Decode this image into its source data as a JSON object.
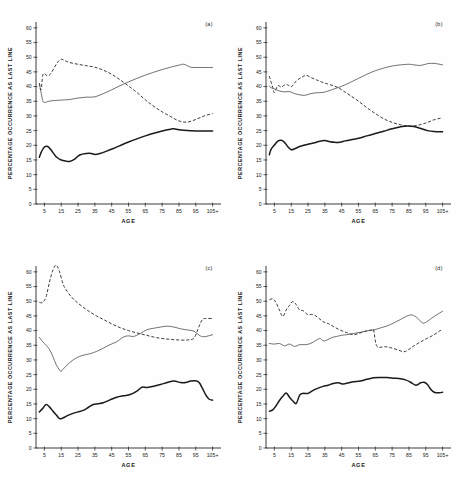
{
  "figure": {
    "axis_title_x": "AGE",
    "axis_title_y": "PERCENTAGE OCCURRENCE AS LAST LINE"
  },
  "chart_data": [
    {
      "type": "line",
      "tag": "(a)",
      "title": "",
      "xlabel": "AGE",
      "ylabel": "PERCENTAGE OCCURRENCE AS LAST LINE",
      "xlim": [
        0,
        110
      ],
      "ylim": [
        0,
        62
      ],
      "yticks": [
        0,
        5,
        10,
        15,
        20,
        25,
        30,
        35,
        40,
        45,
        50,
        55,
        60
      ],
      "xticks": [
        5,
        15,
        25,
        35,
        45,
        55,
        65,
        75,
        85,
        95,
        105
      ],
      "xticklabels": [
        "5",
        "15",
        "25",
        "35",
        "45",
        "55",
        "65",
        "75",
        "85",
        "95",
        "105+"
      ],
      "grid": false,
      "legend": "none",
      "series": [
        {
          "name": "dashed",
          "style": "dashed",
          "x": [
            2,
            3,
            4,
            5,
            7,
            9,
            11,
            13,
            15,
            17,
            20,
            25,
            30,
            35,
            40,
            45,
            50,
            55,
            60,
            65,
            70,
            75,
            80,
            85,
            90,
            95,
            100,
            105
          ],
          "values": [
            41.2,
            38.9,
            43.8,
            44.4,
            43.6,
            44.6,
            46.6,
            48.4,
            49.3,
            48.9,
            48.2,
            47.6,
            47.1,
            46.6,
            45.6,
            44.2,
            42.3,
            40.2,
            38.0,
            35.5,
            33.3,
            31.4,
            29.8,
            28.3,
            27.9,
            28.8,
            30.0,
            30.8
          ]
        },
        {
          "name": "thin-solid",
          "style": "thin",
          "x": [
            2,
            3,
            4,
            5,
            7,
            10,
            15,
            20,
            25,
            30,
            35,
            40,
            45,
            50,
            55,
            60,
            65,
            70,
            75,
            80,
            85,
            88,
            92,
            96,
            100,
            105
          ],
          "values": [
            41.0,
            38.0,
            35.2,
            34.6,
            34.9,
            35.2,
            35.4,
            35.6,
            36.1,
            36.4,
            36.5,
            37.6,
            38.9,
            40.3,
            41.6,
            42.8,
            43.9,
            44.9,
            45.8,
            46.6,
            47.3,
            47.6,
            46.6,
            46.5,
            46.5,
            46.5
          ]
        },
        {
          "name": "thick-solid",
          "style": "thick",
          "x": [
            2,
            3,
            5,
            7,
            9,
            12,
            15,
            18,
            20,
            23,
            26,
            30,
            33,
            35,
            38,
            42,
            46,
            50,
            55,
            60,
            65,
            70,
            75,
            80,
            82,
            85,
            90,
            95,
            100,
            105
          ],
          "values": [
            15.9,
            17.5,
            19.4,
            19.6,
            18.4,
            16.1,
            15.0,
            14.6,
            14.5,
            15.3,
            16.7,
            17.2,
            17.2,
            16.9,
            17.2,
            18.0,
            18.9,
            19.9,
            21.1,
            22.2,
            23.2,
            24.1,
            24.9,
            25.5,
            25.6,
            25.3,
            25.0,
            24.9,
            24.9,
            24.9
          ]
        }
      ]
    },
    {
      "type": "line",
      "tag": "(b)",
      "title": "",
      "xlabel": "AGE",
      "ylabel": "PERCENTAGE OCCURRENCE AS LAST LINE",
      "xlim": [
        0,
        110
      ],
      "ylim": [
        0,
        62
      ],
      "yticks": [
        0,
        5,
        10,
        15,
        20,
        25,
        30,
        35,
        40,
        45,
        50,
        55,
        60
      ],
      "xticks": [
        5,
        15,
        25,
        35,
        45,
        55,
        65,
        75,
        85,
        95,
        105
      ],
      "xticklabels": [
        "5",
        "15",
        "25",
        "35",
        "45",
        "55",
        "65",
        "75",
        "85",
        "95",
        "105+"
      ],
      "grid": false,
      "legend": "none",
      "series": [
        {
          "name": "dashed",
          "style": "dashed",
          "x": [
            2,
            3,
            4,
            5,
            7,
            9,
            11,
            13,
            15,
            18,
            21,
            24,
            27,
            30,
            33,
            36,
            40,
            43,
            46,
            50,
            55,
            60,
            65,
            70,
            75,
            80,
            85,
            90,
            95,
            100,
            105
          ],
          "values": [
            43.6,
            41.5,
            39.7,
            38.0,
            40.3,
            39.8,
            40.5,
            40.6,
            39.9,
            41.9,
            43.1,
            43.8,
            43.0,
            42.3,
            41.6,
            41.0,
            40.3,
            39.6,
            38.5,
            37.0,
            35.0,
            32.8,
            30.8,
            29.0,
            27.8,
            27.0,
            26.5,
            26.8,
            27.6,
            28.7,
            29.4
          ]
        },
        {
          "name": "thin-solid",
          "style": "thin",
          "x": [
            2,
            3,
            5,
            8,
            11,
            14,
            17,
            20,
            23,
            26,
            30,
            34,
            38,
            41,
            45,
            50,
            55,
            60,
            65,
            70,
            75,
            80,
            85,
            88,
            92,
            96,
            100,
            105
          ],
          "values": [
            40.2,
            39.6,
            39.2,
            38.5,
            38.2,
            38.3,
            37.6,
            37.2,
            37.0,
            37.5,
            37.9,
            38.0,
            38.7,
            39.3,
            40.1,
            41.4,
            42.8,
            44.2,
            45.4,
            46.3,
            47.0,
            47.4,
            47.6,
            47.4,
            47.2,
            47.8,
            47.9,
            47.4
          ]
        },
        {
          "name": "thick-solid",
          "style": "thick",
          "x": [
            2,
            3,
            5,
            7,
            9,
            11,
            13,
            15,
            17,
            20,
            23,
            26,
            29,
            32,
            35,
            38,
            41,
            44,
            47,
            50,
            55,
            60,
            65,
            70,
            75,
            80,
            84,
            88,
            92,
            96,
            100,
            105
          ],
          "values": [
            16.8,
            18.6,
            20.1,
            21.4,
            21.7,
            21.0,
            19.5,
            18.5,
            18.8,
            19.6,
            20.1,
            20.5,
            20.9,
            21.4,
            21.6,
            21.2,
            21.0,
            21.0,
            21.5,
            21.8,
            22.4,
            23.2,
            24.0,
            24.8,
            25.6,
            26.3,
            26.6,
            26.4,
            25.7,
            25.0,
            24.7,
            24.6
          ]
        }
      ]
    },
    {
      "type": "line",
      "tag": "(c)",
      "title": "",
      "xlabel": "AGE",
      "ylabel": "PERCENTAGE OCCURRENCE AS LAST LINE",
      "xlim": [
        0,
        110
      ],
      "ylim": [
        0,
        62
      ],
      "yticks": [
        0,
        5,
        10,
        15,
        20,
        25,
        30,
        35,
        40,
        45,
        50,
        55,
        60
      ],
      "xticks": [
        5,
        15,
        25,
        35,
        45,
        55,
        65,
        75,
        85,
        95,
        105
      ],
      "xticklabels": [
        "5",
        "15",
        "25",
        "35",
        "45",
        "55",
        "65",
        "75",
        "85",
        "95",
        "105+"
      ],
      "grid": false,
      "legend": "none",
      "series": [
        {
          "name": "dashed",
          "style": "dashed",
          "x": [
            2,
            4,
            6,
            8,
            10,
            12,
            14,
            16,
            18,
            21,
            24,
            28,
            32,
            36,
            40,
            45,
            50,
            55,
            60,
            65,
            70,
            75,
            80,
            85,
            90,
            94,
            97,
            99,
            101,
            105
          ],
          "values": [
            49.6,
            49.6,
            51.5,
            56.5,
            60.5,
            62.3,
            60.0,
            56.0,
            53.8,
            51.5,
            49.8,
            48.0,
            46.4,
            45.0,
            43.8,
            42.3,
            41.0,
            40.0,
            39.2,
            38.5,
            37.8,
            37.3,
            37.0,
            36.8,
            36.8,
            37.5,
            41.5,
            43.8,
            44.1,
            44.1
          ]
        },
        {
          "name": "thin-solid",
          "style": "thin",
          "x": [
            2,
            4,
            6,
            8,
            10,
            12,
            14,
            15,
            17,
            20,
            24,
            28,
            32,
            36,
            40,
            44,
            48,
            52,
            55,
            58,
            62,
            66,
            70,
            74,
            78,
            82,
            86,
            90,
            94,
            97,
            100,
            105
          ],
          "values": [
            37.7,
            36.2,
            35.0,
            33.6,
            31.2,
            28.4,
            26.6,
            26.2,
            27.4,
            29.1,
            30.7,
            31.6,
            32.1,
            32.9,
            34.0,
            35.2,
            36.2,
            37.8,
            38.2,
            38.0,
            39.0,
            40.3,
            40.8,
            41.2,
            41.5,
            41.2,
            40.6,
            40.2,
            39.8,
            38.4,
            37.9,
            38.6
          ]
        },
        {
          "name": "thick-solid",
          "style": "thick",
          "x": [
            2,
            4,
            6,
            8,
            10,
            12,
            14,
            16,
            19,
            22,
            25,
            28,
            31,
            34,
            37,
            40,
            44,
            48,
            52,
            56,
            60,
            63,
            66,
            70,
            74,
            78,
            82,
            86,
            89,
            92,
            95,
            97,
            99,
            101,
            103,
            105
          ],
          "values": [
            12.3,
            13.5,
            14.8,
            14.0,
            12.6,
            11.3,
            10.0,
            10.2,
            11.1,
            11.8,
            12.3,
            12.8,
            13.8,
            14.8,
            15.1,
            15.4,
            16.4,
            17.3,
            17.8,
            18.2,
            19.4,
            20.7,
            20.6,
            21.0,
            21.6,
            22.3,
            22.8,
            22.3,
            22.3,
            22.8,
            22.9,
            22.3,
            20.3,
            18.0,
            16.6,
            16.3
          ]
        }
      ]
    },
    {
      "type": "line",
      "tag": "(d)",
      "title": "",
      "xlabel": "AGE",
      "ylabel": "PERCENTAGE OCCURRENCE AS LAST LINE",
      "xlim": [
        0,
        110
      ],
      "ylim": [
        0,
        62
      ],
      "yticks": [
        0,
        5,
        10,
        15,
        20,
        25,
        30,
        35,
        40,
        45,
        50,
        55,
        60
      ],
      "xticks": [
        5,
        15,
        25,
        35,
        45,
        55,
        65,
        75,
        85,
        95,
        105
      ],
      "xticklabels": [
        "5",
        "15",
        "25",
        "35",
        "45",
        "55",
        "65",
        "75",
        "85",
        "95",
        "105+"
      ],
      "grid": false,
      "legend": "none",
      "series": [
        {
          "name": "dashed",
          "style": "dashed",
          "x": [
            2,
            4,
            6,
            8,
            10,
            12,
            14,
            16,
            18,
            20,
            22,
            25,
            28,
            31,
            34,
            37,
            40,
            44,
            48,
            52,
            56,
            60,
            63,
            64,
            65,
            66,
            68,
            71,
            74,
            78,
            82,
            85,
            88,
            92,
            96,
            100,
            103,
            105
          ],
          "values": [
            50.5,
            50.8,
            49.5,
            47.0,
            44.8,
            47.0,
            48.6,
            49.9,
            48.8,
            47.0,
            46.8,
            45.4,
            45.5,
            44.4,
            43.0,
            42.4,
            41.4,
            40.2,
            39.3,
            38.6,
            39.2,
            39.9,
            40.2,
            40.2,
            36.5,
            34.6,
            34.3,
            34.5,
            34.2,
            33.5,
            32.8,
            33.6,
            34.8,
            36.2,
            37.4,
            38.6,
            39.8,
            40.4
          ]
        },
        {
          "name": "thin-solid",
          "style": "thin",
          "x": [
            2,
            5,
            8,
            11,
            14,
            17,
            20,
            23,
            26,
            29,
            32,
            34,
            36,
            39,
            42,
            45,
            48,
            52,
            56,
            60,
            64,
            68,
            72,
            76,
            80,
            84,
            87,
            90,
            93,
            95,
            97,
            100,
            103,
            105
          ],
          "values": [
            35.6,
            35.4,
            35.6,
            34.8,
            35.4,
            34.6,
            35.2,
            35.2,
            35.5,
            36.4,
            37.3,
            36.5,
            36.7,
            37.6,
            38.0,
            38.4,
            38.6,
            39.0,
            39.4,
            39.9,
            40.2,
            40.9,
            41.6,
            42.6,
            43.8,
            45.0,
            45.3,
            44.3,
            42.6,
            42.8,
            43.6,
            44.8,
            45.9,
            46.6
          ]
        },
        {
          "name": "thick-solid",
          "style": "thick",
          "x": [
            2,
            4,
            6,
            8,
            10,
            12,
            14,
            16,
            18,
            20,
            22,
            25,
            28,
            31,
            34,
            37,
            40,
            43,
            46,
            49,
            52,
            56,
            60,
            64,
            68,
            72,
            76,
            80,
            83,
            86,
            89,
            92,
            94,
            96,
            98,
            100,
            103,
            105
          ],
          "values": [
            12.5,
            13.0,
            14.4,
            16.2,
            17.6,
            18.7,
            17.3,
            16.0,
            15.2,
            18.0,
            18.6,
            18.6,
            19.6,
            20.4,
            21.0,
            21.4,
            22.0,
            22.2,
            21.8,
            22.2,
            22.6,
            22.8,
            23.4,
            23.9,
            24.0,
            24.0,
            23.8,
            23.6,
            23.2,
            22.4,
            21.4,
            22.2,
            22.4,
            21.6,
            20.0,
            19.0,
            18.8,
            19.0
          ]
        }
      ]
    }
  ]
}
